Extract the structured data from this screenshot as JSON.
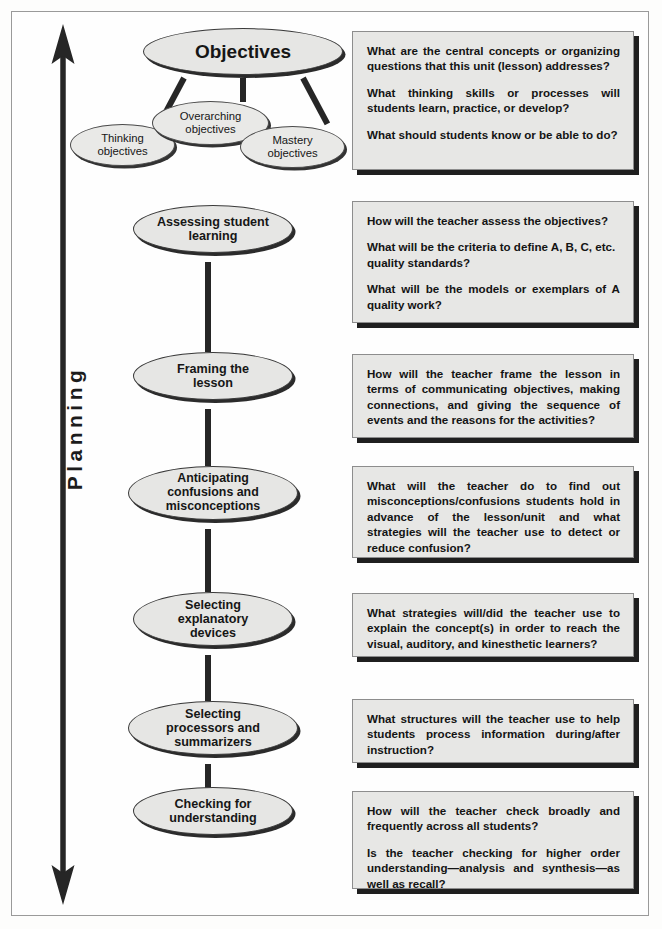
{
  "axis": {
    "label": "Planning",
    "arrow_direction": "double-ended-vertical"
  },
  "objectives": {
    "root": {
      "label": "Objectives"
    },
    "children": [
      {
        "label": "Thinking objectives"
      },
      {
        "label": "Overarching objectives"
      },
      {
        "label": "Mastery objectives"
      }
    ]
  },
  "stages": [
    {
      "id": "objectives",
      "label": "Objectives"
    },
    {
      "id": "assessing",
      "label": "Assessing student learning"
    },
    {
      "id": "framing",
      "label": "Framing the lesson"
    },
    {
      "id": "anticipating",
      "label": "Anticipating confusions and misconceptions"
    },
    {
      "id": "explanatory",
      "label": "Selecting explanatory devices"
    },
    {
      "id": "processors",
      "label": "Selecting processors and summarizers"
    },
    {
      "id": "checking",
      "label": "Checking for understanding"
    }
  ],
  "question_boxes": [
    {
      "for": "objectives",
      "questions": [
        "What are the central concepts or organizing questions that this unit (lesson) addresses?",
        "What thinking skills or processes will students learn, practice, or develop?",
        "What should students know or be able to do?"
      ]
    },
    {
      "for": "assessing",
      "questions": [
        "How will the teacher assess the objectives?",
        "What will be the criteria to define A, B, C, etc. quality standards?",
        "What will be the models or exemplars of A quality work?"
      ]
    },
    {
      "for": "framing",
      "questions": [
        "How will the teacher frame the lesson in terms of communicating objectives, making connections, and giving the sequence of events and the reasons for the activities?"
      ]
    },
    {
      "for": "anticipating",
      "questions": [
        "What will the teacher do to find out misconceptions/confusions students hold in advance of the lesson/unit and what strategies will the teacher use to detect or reduce confusion?"
      ]
    },
    {
      "for": "explanatory",
      "questions": [
        "What strategies will/did the teacher use to explain the concept(s) in order to reach the visual, auditory, and kinesthetic learners?"
      ]
    },
    {
      "for": "processors",
      "questions": [
        "What structures will the teacher use to help students process information during/after instruction?"
      ]
    },
    {
      "for": "checking",
      "questions": [
        "How will the teacher check broadly and frequently across all students?",
        "Is the teacher checking for higher order understanding—analysis and synthesis—as well as recall?"
      ]
    }
  ],
  "colors": {
    "ellipse_fill": "#e6e6e4",
    "ellipse_stroke": "#3a3a3a",
    "box_fill": "#e7e7e5",
    "box_border": "#8d8d8d",
    "shadow": "#1f1f1f",
    "connector": "#262626",
    "frame_border": "#9a9a9a",
    "text": "#141414"
  }
}
